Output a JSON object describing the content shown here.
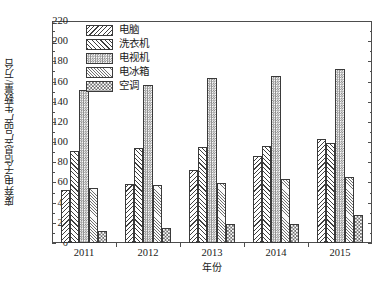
{
  "chart_data": {
    "type": "bar",
    "title": "",
    "subtitle": "",
    "xlabel": "年份",
    "ylabel": "废弃电子信息产品产生数量/万台",
    "categories": [
      "2011",
      "2012",
      "2013",
      "2014",
      "2015"
    ],
    "ylim": [
      0,
      220
    ],
    "y_ticks": [
      0,
      20,
      40,
      60,
      80,
      100,
      120,
      140,
      160,
      180,
      200,
      220
    ],
    "y_tick_labels": [
      "0",
      "20",
      "40",
      "60",
      "80",
      "100",
      "120",
      "140",
      "160",
      "180",
      "200",
      "220"
    ],
    "y_minor_interval": 10,
    "grid": false,
    "legend_position": "top-center",
    "series": [
      {
        "name": "电脑",
        "pattern": "backslash-hatch",
        "color": "#3f3f3f",
        "values": [
          53,
          58,
          72,
          86,
          103
        ]
      },
      {
        "name": "洗衣机",
        "pattern": "forward-slash-hatch",
        "color": "#3f3f3f",
        "values": [
          91,
          94,
          95,
          96,
          99
        ]
      },
      {
        "name": "电视机",
        "pattern": "fine-checker",
        "color": "#8c8c8c",
        "values": [
          152,
          157,
          164,
          166,
          172
        ]
      },
      {
        "name": "电冰箱",
        "pattern": "light-diagonal",
        "color": "#6f6f6f",
        "values": [
          55,
          57,
          59,
          63,
          65
        ]
      },
      {
        "name": "空调",
        "pattern": "coarse-checker",
        "color": "#6b6b6b",
        "values": [
          12,
          15,
          19,
          19,
          28
        ]
      }
    ]
  },
  "axes": {
    "frame_color": "#4d4d4d",
    "background": "#ffffff"
  }
}
